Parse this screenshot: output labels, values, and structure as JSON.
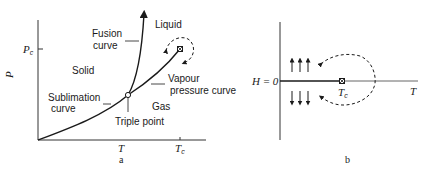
{
  "panel_a": {
    "caption": "a",
    "y_axis_label": "P",
    "y_tick_label": "P",
    "y_tick_sub": "c",
    "x_tick_label_1": "T",
    "x_tick_label_2": "T",
    "x_tick_label_2_sub": "c",
    "regions": {
      "liquid": "Liquid",
      "solid": "Solid",
      "gas": "Gas"
    },
    "curves": {
      "fusion_line1": "Fusion",
      "fusion_line2": "curve",
      "sublimation_line1": "Sublimation",
      "sublimation_line2": "curve",
      "vapour_line1": "Vapour",
      "vapour_line2": "pressure curve"
    },
    "points": {
      "triple": "Triple point"
    }
  },
  "panel_b": {
    "caption": "b",
    "h_label": "H = 0",
    "x_axis_label": "T",
    "tc_label": "T",
    "tc_sub": "c"
  },
  "colors": {
    "ink": "#1a1a1a",
    "axis": "#333333",
    "background": "#ffffff"
  }
}
